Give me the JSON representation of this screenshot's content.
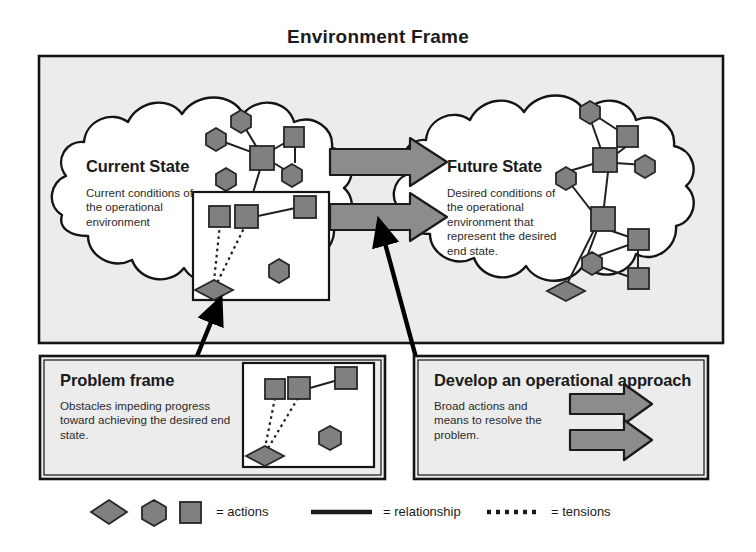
{
  "diagram": {
    "title": "Environment Frame",
    "colors": {
      "frame_fill": "#ececec",
      "frame_border": "#141414",
      "cloud_fill": "#ffffff",
      "cloud_border": "#141414",
      "node_fill": "#808080",
      "node_border": "#262626",
      "big_arrow_fill": "#8c8c8c",
      "big_arrow_border": "#1a1a1a",
      "pointer_arrow": "#000000",
      "inner_box_fill": "#ffffff",
      "text": "#1b1b1b"
    },
    "panels": {
      "current_state": {
        "heading": "Current State",
        "body": "Current conditions of the operational environment"
      },
      "future_state": {
        "heading": "Future State",
        "body": "Desired conditions of the operational environment that represent the desired end state."
      },
      "problem_frame": {
        "heading": "Problem frame",
        "body": "Obstacles impeding progress toward achieving the desired end state."
      },
      "operational_approach": {
        "heading": "Develop an operational approach",
        "body": "Broad actions and means to resolve the problem."
      }
    },
    "legend": {
      "actions_label": "= actions",
      "relationship_label": "= relationship",
      "tensions_label": "= tensions",
      "shape_names": [
        "diamond",
        "hexagon",
        "square"
      ]
    },
    "arrows": {
      "transition_count": 2,
      "approach_arrow_count": 2,
      "pointer_count": 2
    }
  }
}
